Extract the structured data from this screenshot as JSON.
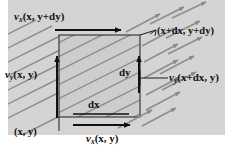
{
  "figure": {
    "background_color": "#ffffff",
    "panel_color": "#d2d2d2",
    "hatch_color": "#8a8a8a",
    "line_color": "#111111",
    "rect_fill": "#cfcfcf"
  },
  "labels": {
    "top_velocity": {
      "symbol": "v",
      "sub": "x",
      "args": "(x, y+dy)"
    },
    "left_velocity": {
      "symbol": "v",
      "sub": "y",
      "args": "(x, y)"
    },
    "right_velocity": {
      "symbol": "v",
      "sub": "y",
      "args": "(x+dx, y)"
    },
    "bottom_velocity": {
      "symbol": "v",
      "sub": "x",
      "args": "(x, y)"
    },
    "corner_bottom_left": "(x, y)",
    "corner_top_right": "(x+dx, y+dy)",
    "width_label": "dx",
    "height_label": "dy"
  },
  "geometry": {
    "rect": {
      "x": 59,
      "y": 35,
      "width": 81,
      "height": 82
    },
    "panel": {
      "x": 8,
      "y": 0,
      "width": 217,
      "height": 135
    },
    "hatch_angle_deg": 27,
    "hatch_spacing": 13
  },
  "arrows": {
    "top_horizontal": {
      "from_x": 55,
      "to_x": 121,
      "y": 30,
      "direction": "right"
    },
    "bottom_horizontal": {
      "from_x": 73,
      "to_x": 130,
      "y": 125,
      "direction": "right"
    },
    "left_vertical": {
      "x": 57,
      "from_y": 118,
      "to_y": 56,
      "direction": "up"
    },
    "right_vertical": {
      "x": 139,
      "from_y": 93,
      "to_y": 56,
      "direction": "up"
    },
    "flow_field_count": 14,
    "flow_field_direction": "up-right"
  }
}
